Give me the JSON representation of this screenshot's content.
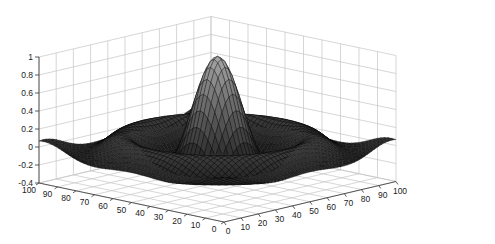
{
  "chart_data": {
    "type": "surface",
    "title": "",
    "xlabel": "",
    "ylabel": "",
    "zlabel": "",
    "function": "z = sin(r)/r (sinc), centered at (50,50)",
    "x_range": [
      0,
      100
    ],
    "y_range": [
      0,
      100
    ],
    "zlim": [
      -0.4,
      1
    ],
    "grid": true,
    "colormap": "gray",
    "x_ticks": [
      "0",
      "10",
      "20",
      "30",
      "40",
      "50",
      "60",
      "70",
      "80",
      "90",
      "100"
    ],
    "y_ticks": [
      "0",
      "10",
      "20",
      "30",
      "40",
      "50",
      "60",
      "70",
      "80",
      "90",
      "100"
    ],
    "z_ticks": [
      "-0.4",
      "-0.2",
      "0",
      "0.2",
      "0.4",
      "0.6",
      "0.8",
      "1"
    ],
    "peak": {
      "x": 50,
      "y": 50,
      "z": 1.0
    },
    "corner_values": {
      "min_z_approx": -0.22,
      "edge_z_approx": 0.05
    }
  }
}
